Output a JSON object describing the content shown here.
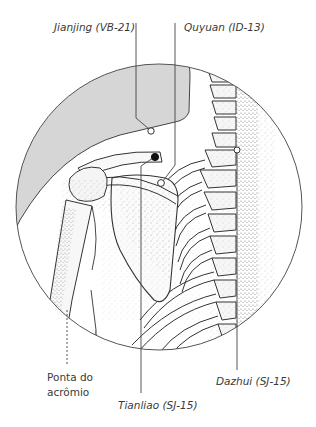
{
  "figure": {
    "type": "anatomical-illustration",
    "colors": {
      "line": "#3a3a3a",
      "shade": "#d4d4d4",
      "background": "#ffffff",
      "point_filled": "#111111",
      "point_open": "#ffffff"
    }
  },
  "labels": {
    "jianjing": "Jianjing (VB-21)",
    "quyuan": "Quyuan (ID-13)",
    "tianliao": "Tianliao (SJ-15)",
    "dazhui": "Dazhui (SJ-15)",
    "acromion_line1": "Ponta do",
    "acromion_line2": "acrômio"
  },
  "points": [
    {
      "id": "jianjing",
      "marker": "open",
      "x": 151,
      "y": 131
    },
    {
      "id": "tianliao",
      "marker": "filled",
      "x": 155,
      "y": 157
    },
    {
      "id": "quyuan",
      "marker": "open",
      "x": 161,
      "y": 183
    },
    {
      "id": "dazhui",
      "marker": "open",
      "x": 237,
      "y": 150
    }
  ]
}
